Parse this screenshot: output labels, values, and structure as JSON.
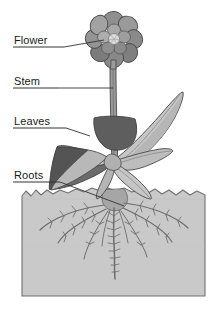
{
  "diagram": {
    "background_color": "#ffffff",
    "labels": [
      {
        "id": "flower",
        "text": "Flower",
        "x": 14,
        "y": 44,
        "underline_x1": 13,
        "underline_x2": 64,
        "underline_y": 47,
        "leader": "M64,47 L104,41"
      },
      {
        "id": "stem",
        "text": "Stem",
        "x": 14,
        "y": 85,
        "underline_x1": 13,
        "underline_x2": 58,
        "underline_y": 88,
        "leader": "M58,88 L116,88"
      },
      {
        "id": "leaves",
        "text": "Leaves",
        "x": 14,
        "y": 125,
        "underline_x1": 13,
        "underline_x2": 66,
        "underline_y": 128,
        "leader": "M66,128 L88,135"
      },
      {
        "id": "roots",
        "text": "Roots",
        "x": 14,
        "y": 179,
        "underline_x1": 13,
        "underline_x2": 60,
        "underline_y": 182,
        "leader": "M60,182 L122,205"
      }
    ],
    "colors": {
      "outline": "#4a4a4a",
      "stroke_dark": "#3a3a3a",
      "flower_petal_light": "#b9b9b9",
      "flower_petal_mid": "#8e8e8e",
      "flower_petal_dark": "#6e6e6e",
      "flower_center": "#d8d8d8",
      "stem": "#8f8f8f",
      "leaf_light": "#c3c3c3",
      "leaf_mid": "#a8a8a8",
      "leaf_dark": "#6b6b6b",
      "leaf_darkest": "#5a5a5a",
      "soil": "#c9c9c9",
      "soil_border": "#707070",
      "root": "#9a9a9a",
      "text": "#1a1a1a",
      "label_rule": "#333333"
    },
    "parts": {
      "flower_label": "Flower",
      "stem_label": "Stem",
      "leaves_label": "Leaves",
      "roots_label": "Roots"
    },
    "soil": {
      "left": 22,
      "right": 205,
      "top": 188,
      "bottom": 296
    }
  }
}
